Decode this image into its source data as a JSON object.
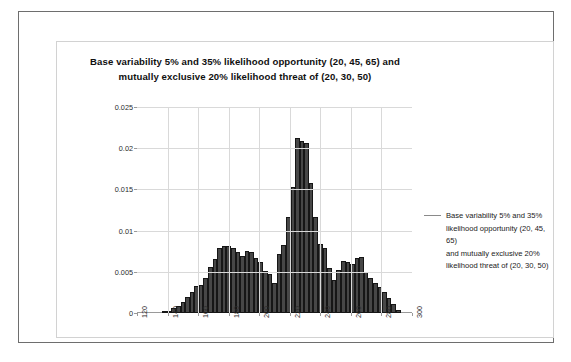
{
  "chart_data": {
    "type": "bar",
    "title": "Base variability 5% and 35% likelihood opportunity (20, 45, 65) and mutually exclusive  20% likelihood threat of (20, 30, 50)",
    "title_lines": [
      "Base variability 5% and 35% likelihood opportunity (20, 45, 65) and",
      "mutually exclusive  20% likelihood threat of (20, 30, 50)"
    ],
    "xlabel": "",
    "ylabel": "",
    "xlim": [
      120,
      300
    ],
    "ylim": [
      0,
      0.025
    ],
    "grid": true,
    "legend_position": "right",
    "series": [
      {
        "name": "Base variability 5% and 35% likelihood opportunity (20, 45, 65) and mutually exclusive 20% likelihood threat of (20, 30, 50)",
        "color": "#474747",
        "x": [
          138,
          141,
          144,
          147,
          150,
          153,
          156,
          159,
          162,
          165,
          168,
          171,
          174,
          177,
          180,
          183,
          186,
          189,
          192,
          195,
          198,
          201,
          204,
          207,
          210,
          213,
          216,
          219,
          222,
          225,
          228,
          231,
          234,
          237,
          240,
          243,
          246,
          249,
          252,
          255,
          258,
          261,
          264,
          267,
          270,
          273,
          276,
          279,
          282,
          285,
          288,
          291
        ],
        "values": [
          0.00012,
          0.0003,
          0.0006,
          0.0009,
          0.0013,
          0.0019,
          0.0026,
          0.0033,
          0.0034,
          0.0043,
          0.0056,
          0.0066,
          0.0079,
          0.0081,
          0.0081,
          0.0079,
          0.0074,
          0.0069,
          0.0075,
          0.0074,
          0.0067,
          0.0062,
          0.0051,
          0.0047,
          0.0037,
          0.0072,
          0.0082,
          0.0117,
          0.0153,
          0.0212,
          0.0209,
          0.0206,
          0.0158,
          0.0116,
          0.0084,
          0.0079,
          0.0055,
          0.004,
          0.0052,
          0.0063,
          0.0062,
          0.006,
          0.0067,
          0.0068,
          0.005,
          0.0043,
          0.0037,
          0.0032,
          0.0025,
          0.0018,
          0.0011,
          0.0004
        ]
      }
    ],
    "y_ticks": [
      "0",
      "0.005",
      "0.01",
      "0.015",
      "0.02",
      "0.025"
    ],
    "y_tick_values": [
      0,
      0.005,
      0.01,
      0.015,
      0.02,
      0.025
    ],
    "x_ticks": [
      "120",
      "140",
      "160",
      "180",
      "200",
      "220",
      "240",
      "260",
      "280",
      "300"
    ],
    "x_tick_values": [
      120,
      140,
      160,
      180,
      200,
      220,
      240,
      260,
      280,
      300
    ]
  },
  "legend": {
    "label": "Base variability 5% and 35% likelihood opportunity (20, 45, 65) and mutually exclusive 20% likelihood threat of (20, 30, 50)",
    "lines": [
      "Base variability 5% and 35%",
      "likelihood opportunity (20, 45, 65)",
      "and mutually exclusive 20%",
      "likelihood threat of (20, 30, 50)"
    ],
    "swatch_color": "#8a8a8a"
  },
  "colors": {
    "bar_fill": "#474747",
    "bar_edge": "#161616",
    "gridline": "#d9d9d9",
    "axis": "#9a9a9a",
    "outer_border": "#6e6e6e",
    "inner_border": "#d2d2d2",
    "background": "#ffffff"
  }
}
